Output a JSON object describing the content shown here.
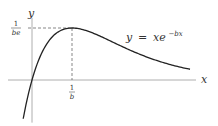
{
  "chart_data": {
    "type": "line",
    "title": "",
    "xlabel": "x",
    "ylabel": "y",
    "function": "y = x e^{-bx}",
    "x_units": "multiples of 1/b",
    "y_units": "multiples of 1/(be)",
    "xlim": [
      -0.6,
      4.1
    ],
    "ylim": [
      -0.82,
      1.27
    ],
    "curve_range": [
      -0.22,
      3.95
    ],
    "series": [
      {
        "name": "y = xe^{-bx}",
        "expression": "u*exp(1-u)"
      }
    ],
    "maximum": {
      "x": 1,
      "y": 1,
      "x_label_num": "1",
      "x_label_den": "b",
      "y_label_num": "1",
      "y_label_den": "be"
    },
    "annotation": {
      "text_y": "y",
      "text_eq": "=",
      "text_x": "xe",
      "text_exp": "−bx"
    },
    "grid": false,
    "colors": {
      "curve": "#222222",
      "axis": "#999999",
      "dash": "#555555"
    }
  }
}
